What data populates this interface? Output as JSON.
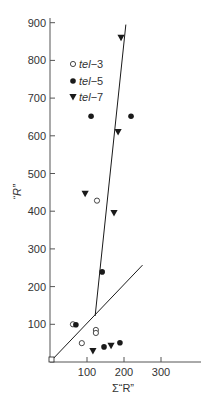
{
  "chart_data": {
    "type": "scatter",
    "title": "",
    "xlabel": "Σ“R”",
    "ylabel": "“R”",
    "xlim": [
      0,
      400
    ],
    "ylim": [
      0,
      920
    ],
    "x_ticks": [
      100,
      200,
      300
    ],
    "y_ticks": [
      100,
      200,
      300,
      400,
      500,
      600,
      700,
      800,
      900
    ],
    "grid": false,
    "legend_position": "upper-left",
    "series": [
      {
        "name": "tel-3",
        "marker": "open-circle",
        "points": [
          [
            5,
            5
          ],
          [
            62,
            100
          ],
          [
            124,
            85
          ],
          [
            124,
            77
          ],
          [
            86,
            50
          ],
          [
            127,
            428
          ]
        ]
      },
      {
        "name": "tel-5",
        "marker": "filled-circle",
        "points": [
          [
            111,
            652
          ],
          [
            219,
            652
          ],
          [
            141,
            239
          ],
          [
            70,
            99
          ],
          [
            146,
            40
          ],
          [
            189,
            51
          ]
        ]
      },
      {
        "name": "tel-7",
        "marker": "filled-down-triangle",
        "points": [
          [
            192,
            860
          ],
          [
            184,
            610
          ],
          [
            95,
            446
          ],
          [
            173,
            395
          ],
          [
            116,
            29
          ],
          [
            165,
            43
          ]
        ]
      }
    ],
    "lines": [
      {
        "name": "diagonal-line",
        "from": [
          0,
          0
        ],
        "to": [
          250,
          257
        ]
      },
      {
        "name": "steep-line",
        "from": [
          122,
          122
        ],
        "to": [
          205,
          895
        ]
      }
    ]
  },
  "legend": [
    {
      "prefix": "tel",
      "suffix": "−3",
      "marker": "open-circle"
    },
    {
      "prefix": "tel",
      "suffix": "−5",
      "marker": "filled-circle"
    },
    {
      "prefix": "tel",
      "suffix": "−7",
      "marker": "filled-down-triangle"
    }
  ],
  "axes": {
    "x_label": "Σ“R”",
    "y_label": "“R”",
    "x_tick_labels": [
      "100",
      "200",
      "300"
    ],
    "y_tick_labels": [
      "100",
      "200",
      "300",
      "400",
      "500",
      "600",
      "700",
      "800",
      "900"
    ]
  },
  "colors": {
    "ink": "#1a1a1a",
    "axis": "#555555",
    "text": "#333333",
    "background": "#ffffff"
  }
}
